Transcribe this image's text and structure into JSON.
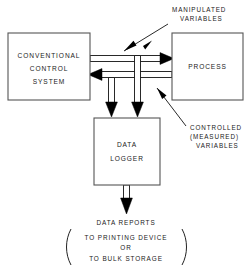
{
  "diagram": {
    "background_color": "#ffffff",
    "line_color": "#111111",
    "box_stroke_color": "#555555",
    "text_color": "#1a1a1a",
    "boxes": [
      {
        "id": "conventional-control-system",
        "lines": [
          "CONVENTIONAL",
          "CONTROL",
          "SYSTEM"
        ],
        "x": 8,
        "y": 33,
        "width": 82,
        "height": 67
      },
      {
        "id": "process",
        "lines": [
          "PROCESS"
        ],
        "x": 172,
        "y": 33,
        "width": 71,
        "height": 67
      },
      {
        "id": "data-logger",
        "lines": [
          "DATA",
          "LOGGER"
        ],
        "x": 94,
        "y": 118,
        "width": 66,
        "height": 67
      }
    ],
    "annotations": [
      {
        "id": "manipulated-variables",
        "lines": [
          "MANIPULATED",
          "VARIABLES"
        ],
        "x": 172,
        "y": 9
      },
      {
        "id": "controlled-measured-variables",
        "lines": [
          "CONTROLLED",
          "(MEASURED)",
          "VARIABLES"
        ],
        "x": 188,
        "y": 124
      }
    ],
    "output": {
      "id": "data-reports",
      "heading": "DATA REPORTS",
      "lines": [
        "TO PRINTING DEVICE",
        "OR",
        "TO BULK STORAGE"
      ]
    },
    "flows": [
      {
        "id": "manipulated-flow",
        "from": "conventional-control-system",
        "to": "process",
        "direction": "right",
        "label_ref": "manipulated-variables"
      },
      {
        "id": "controlled-flow",
        "from": "process",
        "to": "conventional-control-system",
        "direction": "left",
        "label_ref": "controlled-measured-variables"
      },
      {
        "id": "manipulated-tap-to-logger",
        "from": "manipulated-flow",
        "to": "data-logger",
        "direction": "down"
      },
      {
        "id": "controlled-tap-to-logger",
        "from": "controlled-flow",
        "to": "data-logger",
        "direction": "down"
      },
      {
        "id": "logger-to-reports",
        "from": "data-logger",
        "to": "data-reports",
        "direction": "down"
      }
    ]
  }
}
